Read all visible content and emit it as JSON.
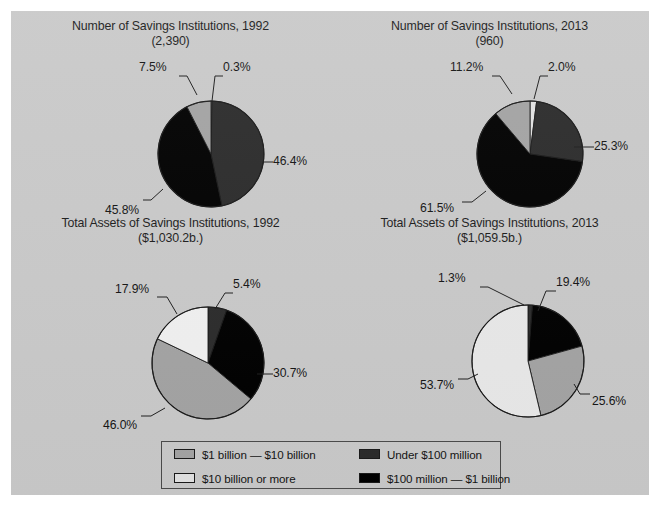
{
  "figure": {
    "background_color": "#c9c9c9",
    "page_background_color": "#ffffff"
  },
  "palette": {
    "one_to_ten_billion": "#a3a3a3",
    "ten_billion_or_more": "#e2e2e2",
    "under_100_million": "#2b2b2b",
    "hundred_million_to_1_billion": "#000000",
    "outline": "#1a1a1a",
    "leader_line": "#1f1f1f",
    "text": "#141414"
  },
  "legend": {
    "items": [
      {
        "label": "$1 billion — $10 billion",
        "color": "#a3a3a3",
        "key": "one_to_ten_billion"
      },
      {
        "label": "Under $100 million",
        "color": "#2b2b2b",
        "key": "under_100_million"
      },
      {
        "label": "$10 billion or more",
        "color": "#e2e2e2",
        "key": "ten_billion_or_more"
      },
      {
        "label": "$100 million — $1 billion",
        "color": "#000000",
        "key": "hundred_million_to_1_billion"
      }
    ]
  },
  "chart_data": [
    {
      "id": "number-1992",
      "type": "pie",
      "title": "Number of Savings Institutions, 1992",
      "subtitle": "(2,390)",
      "total_label": "2,390",
      "categories": [
        "$10 billion or more",
        "$1 billion — $10 billion",
        "Under $100 million",
        "$100 million — $1 billion"
      ],
      "labels": [
        "0.3%",
        "46.4%",
        "45.8%",
        "7.5%"
      ],
      "values": [
        0.3,
        46.4,
        45.8,
        7.5
      ],
      "colors": [
        "#e2e2e2",
        "#2b2b2b",
        "#000000",
        "#a3a3a3"
      ],
      "legend_position": "bottom"
    },
    {
      "id": "number-2013",
      "type": "pie",
      "title": "Number of Savings Institutions, 2013",
      "subtitle": "(960)",
      "total_label": "960",
      "categories": [
        "$10 billion or more",
        "$1 billion — $10 billion",
        "Under $100 million",
        "$100 million — $1 billion"
      ],
      "labels": [
        "2.0%",
        "25.3%",
        "61.5%",
        "11.2%"
      ],
      "values": [
        2.0,
        25.3,
        61.5,
        11.2
      ],
      "colors": [
        "#e2e2e2",
        "#2b2b2b",
        "#000000",
        "#a3a3a3"
      ],
      "legend_position": "bottom"
    },
    {
      "id": "assets-1992",
      "type": "pie",
      "title": "Total Assets of Savings Institutions, 1992",
      "subtitle": "($1,030.2b.)",
      "total_label": "$1,030.2b.",
      "categories": [
        "Under $100 million",
        "$100 million — $1 billion",
        "$1 billion — $10 billion",
        "$10 billion or more"
      ],
      "labels": [
        "5.4%",
        "30.7%",
        "46.0%",
        "17.9%"
      ],
      "values": [
        5.4,
        30.7,
        46.0,
        17.9
      ],
      "colors": [
        "#2b2b2b",
        "#000000",
        "#a3a3a3",
        "#f0f0f0"
      ],
      "legend_position": "bottom"
    },
    {
      "id": "assets-2013",
      "type": "pie",
      "title": "Total Assets of Savings Institutions, 2013",
      "subtitle": "($1,059.5b.)",
      "total_label": "$1,059.5b.",
      "categories": [
        "Under $100 million",
        "$100 million — $1 billion",
        "$1 billion — $10 billion",
        "$10 billion or more"
      ],
      "labels": [
        "1.3%",
        "19.4%",
        "25.6%",
        "53.7%"
      ],
      "values": [
        1.3,
        19.4,
        25.6,
        53.7
      ],
      "colors": [
        "#2b2b2b",
        "#000000",
        "#a3a3a3",
        "#e8e8e8"
      ],
      "legend_position": "bottom"
    }
  ]
}
